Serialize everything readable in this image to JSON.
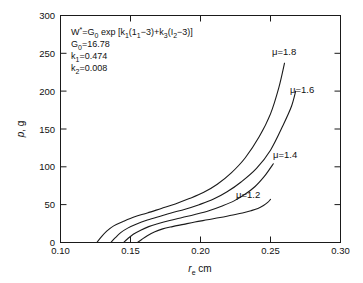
{
  "chart_data": {
    "type": "line",
    "title": "",
    "xlabel": "r_e cm",
    "ylabel": "p, g",
    "xlim": [
      0.1,
      0.3
    ],
    "ylim": [
      0,
      300
    ],
    "grid": false,
    "legend_position": "inline-curve-labels",
    "xticks": [
      "0.10",
      "0.15",
      "0.20",
      "0.25",
      "0.30"
    ],
    "xtick_values": [
      0.1,
      0.15,
      0.2,
      0.25,
      0.3
    ],
    "yticks": [
      "0",
      "50",
      "100",
      "150",
      "200",
      "250",
      "300"
    ],
    "ytick_values": [
      0,
      50,
      100,
      150,
      200,
      250,
      300
    ],
    "series": [
      {
        "name": "mu=1.2",
        "label": "μ=1.2",
        "x": [
          0.155,
          0.158,
          0.162,
          0.167,
          0.173,
          0.18,
          0.188,
          0.196,
          0.205,
          0.214,
          0.222,
          0.23,
          0.236,
          0.241,
          0.245,
          0.248,
          0.25
        ],
        "y": [
          0,
          4,
          9,
          14,
          18,
          21,
          24,
          27,
          30,
          33,
          36,
          39,
          42,
          45,
          49,
          53,
          57
        ]
      },
      {
        "name": "mu=1.4",
        "label": "μ=1.4",
        "x": [
          0.145,
          0.148,
          0.152,
          0.157,
          0.163,
          0.17,
          0.178,
          0.187,
          0.196,
          0.206,
          0.215,
          0.224,
          0.232,
          0.239,
          0.245,
          0.249,
          0.252
        ],
        "y": [
          0,
          5,
          11,
          16,
          21,
          25,
          29,
          33,
          37,
          42,
          48,
          55,
          64,
          74,
          86,
          96,
          104
        ]
      },
      {
        "name": "mu=1.6",
        "label": "μ=1.6",
        "x": [
          0.136,
          0.139,
          0.143,
          0.148,
          0.154,
          0.161,
          0.17,
          0.179,
          0.189,
          0.199,
          0.209,
          0.219,
          0.229,
          0.24,
          0.25,
          0.259,
          0.265,
          0.268
        ],
        "y": [
          0,
          6,
          13,
          19,
          24,
          29,
          34,
          39,
          44,
          50,
          57,
          67,
          80,
          98,
          122,
          155,
          180,
          200
        ]
      },
      {
        "name": "mu=1.8",
        "label": "μ=1.8",
        "x": [
          0.126,
          0.129,
          0.133,
          0.138,
          0.145,
          0.153,
          0.162,
          0.172,
          0.182,
          0.192,
          0.202,
          0.212,
          0.222,
          0.232,
          0.242,
          0.25,
          0.256,
          0.26
        ],
        "y": [
          0,
          7,
          15,
          22,
          28,
          34,
          39,
          45,
          51,
          58,
          66,
          77,
          92,
          112,
          140,
          170,
          205,
          237
        ]
      }
    ],
    "annotation": {
      "equation": "W*=G0 exp [k1(11−3)+k3(I2−3)]",
      "lines": [
        "G0=16.78",
        "k1=0.474",
        "k2=0.008"
      ],
      "G0_value": "16.78",
      "k1_value": "0.474",
      "k2_value": "0.008"
    }
  },
  "axes": {
    "x_label_main": "r",
    "x_label_sub": "e",
    "x_label_unit": "cm",
    "y_label_main": "p",
    "y_label_unit": ", g"
  },
  "annotation_text": {
    "eq_W": "W",
    "eq_star": "*",
    "eq_eq": "=G",
    "eq_G_sub": "0",
    "eq_exp": " exp [k",
    "eq_k1_sub": "1",
    "eq_open": "(1",
    "eq_one_sub": "1",
    "eq_minus3": "−3)+k",
    "eq_k3_sub": "3",
    "eq_openI": "(I",
    "eq_I2_sub": "2",
    "eq_tail": "−3)]",
    "line2_name": "G",
    "line2_sub": "0",
    "line2_val": "=16.78",
    "line3_name": "k",
    "line3_sub": "1",
    "line3_val": "=0.474",
    "line4_name": "k",
    "line4_sub": "2",
    "line4_val": "=0.008"
  },
  "series_labels": {
    "mu18": "μ=1.8",
    "mu16": "μ=1.6",
    "mu14": "μ=1.4",
    "mu12": "μ=1.2"
  },
  "ticks": {
    "x": [
      "0.10",
      "0.15",
      "0.20",
      "0.25",
      "0.30"
    ],
    "y": [
      "0",
      "50",
      "100",
      "150",
      "200",
      "250",
      "300"
    ]
  },
  "colors": {
    "background": "#ffffff",
    "ink": "#1a1a1a",
    "curve": "#1a1a1a"
  }
}
